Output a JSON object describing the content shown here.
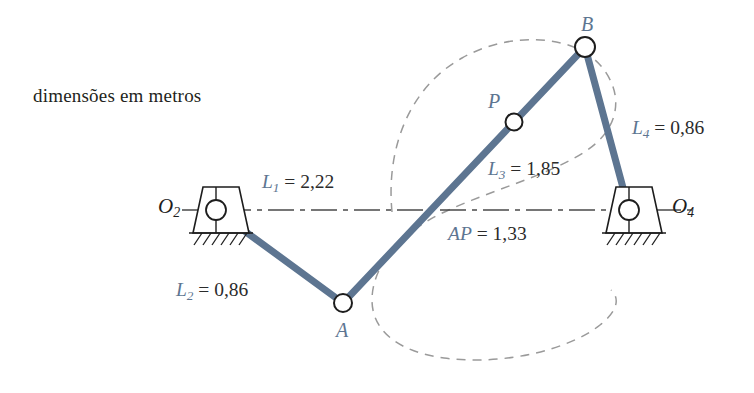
{
  "figure": {
    "note": "dimensões em metros",
    "background": "#ffffff",
    "link_color": "#5d7591",
    "label_color": "#5d7591",
    "curve_color": "#9a9a9a",
    "ground_color": "#1d1d1d"
  },
  "dimensions": {
    "l1": {
      "name": "L",
      "sub": "1",
      "eq": " = ",
      "value": "2,22"
    },
    "l2": {
      "name": "L",
      "sub": "2",
      "eq": " = ",
      "value": "0,86"
    },
    "l3": {
      "name": "L",
      "sub": "3",
      "eq": " = ",
      "value": "1,85"
    },
    "l4": {
      "name": "L",
      "sub": "4",
      "eq": " = ",
      "value": "0,86"
    },
    "ap": {
      "name": "AP",
      "sub": "",
      "eq": " = ",
      "value": "1,33"
    }
  },
  "points": {
    "o2": {
      "name": "O",
      "sub": "2"
    },
    "o4": {
      "name": "O",
      "sub": "4"
    },
    "a": "A",
    "b": "B",
    "p": "P"
  }
}
